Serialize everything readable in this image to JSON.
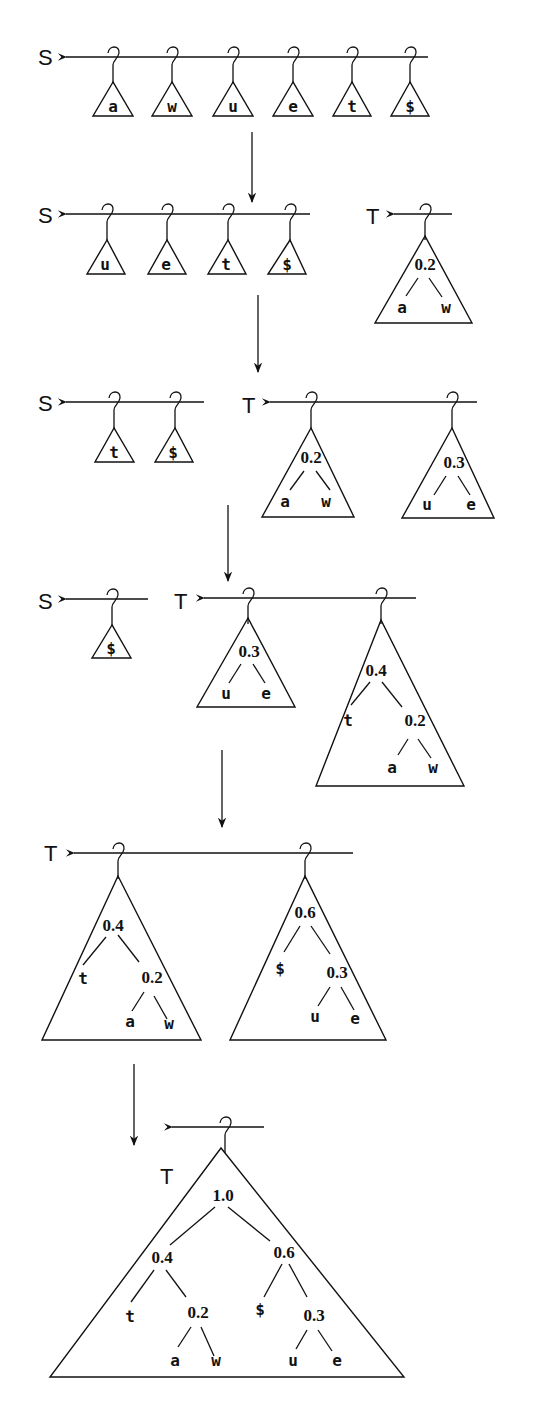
{
  "diagram": {
    "type": "huffman-tree-construction",
    "colors": {
      "ink": "#111111",
      "background": "#ffffff"
    },
    "steps": [
      {
        "S": {
          "label": "S",
          "items": [
            "a",
            "w",
            "u",
            "e",
            "t",
            "$"
          ]
        }
      },
      {
        "S": {
          "label": "S",
          "items": [
            "u",
            "e",
            "t",
            "$"
          ]
        },
        "T": {
          "label": "T",
          "trees": [
            {
              "root": "0.2",
              "children": [
                "a",
                "w"
              ]
            }
          ]
        }
      },
      {
        "S": {
          "label": "S",
          "items": [
            "t",
            "$"
          ]
        },
        "T": {
          "label": "T",
          "trees": [
            {
              "root": "0.2",
              "children": [
                "a",
                "w"
              ]
            },
            {
              "root": "0.3",
              "children": [
                "u",
                "e"
              ]
            }
          ]
        }
      },
      {
        "S": {
          "label": "S",
          "items": [
            "$"
          ]
        },
        "T": {
          "label": "T",
          "trees": [
            {
              "root": "0.3",
              "children": [
                "u",
                "e"
              ]
            },
            {
              "root": "0.4",
              "children": [
                "t",
                {
                  "root": "0.2",
                  "children": [
                    "a",
                    "w"
                  ]
                }
              ]
            }
          ]
        }
      },
      {
        "T": {
          "label": "T",
          "trees": [
            {
              "root": "0.4",
              "children": [
                "t",
                {
                  "root": "0.2",
                  "children": [
                    "a",
                    "w"
                  ]
                }
              ]
            },
            {
              "root": "0.6",
              "children": [
                "$",
                {
                  "root": "0.3",
                  "children": [
                    "u",
                    "e"
                  ]
                }
              ]
            }
          ]
        }
      },
      {
        "T": {
          "label": "T",
          "trees": [
            {
              "root": "1.0",
              "children": [
                {
                  "root": "0.4",
                  "children": [
                    "t",
                    {
                      "root": "0.2",
                      "children": [
                        "a",
                        "w"
                      ]
                    }
                  ]
                },
                {
                  "root": "0.6",
                  "children": [
                    "$",
                    {
                      "root": "0.3",
                      "children": [
                        "u",
                        "e"
                      ]
                    }
                  ]
                }
              ]
            }
          ]
        }
      }
    ]
  },
  "labels": {
    "s1": {
      "S": "S",
      "items": [
        "a",
        "w",
        "u",
        "e",
        "t",
        "$"
      ]
    },
    "s2": {
      "S": "S",
      "items": [
        "u",
        "e",
        "t",
        "$"
      ],
      "T": "T",
      "t0": {
        "root": "0.2",
        "l": "a",
        "r": "w"
      }
    },
    "s3": {
      "S": "S",
      "items": [
        "t",
        "$"
      ],
      "T": "T",
      "t0": {
        "root": "0.2",
        "l": "a",
        "r": "w"
      },
      "t1": {
        "root": "0.3",
        "l": "u",
        "r": "e"
      }
    },
    "s4": {
      "S": "S",
      "items": [
        "$"
      ],
      "T": "T",
      "t0": {
        "root": "0.3",
        "l": "u",
        "r": "e"
      },
      "t1": {
        "root": "0.4",
        "l": "t",
        "sub": "0.2",
        "sl": "a",
        "sr": "w"
      }
    },
    "s5": {
      "T": "T",
      "t0": {
        "root": "0.4",
        "l": "t",
        "sub": "0.2",
        "sl": "a",
        "sr": "w"
      },
      "t1": {
        "root": "0.6",
        "l": "$",
        "sub": "0.3",
        "sl": "u",
        "sr": "e"
      }
    },
    "s6": {
      "T": "T",
      "root": "1.0",
      "L": {
        "root": "0.4",
        "l": "t",
        "sub": "0.2",
        "sl": "a",
        "sr": "w"
      },
      "R": {
        "root": "0.6",
        "l": "$",
        "sub": "0.3",
        "sl": "u",
        "sr": "e"
      }
    }
  }
}
